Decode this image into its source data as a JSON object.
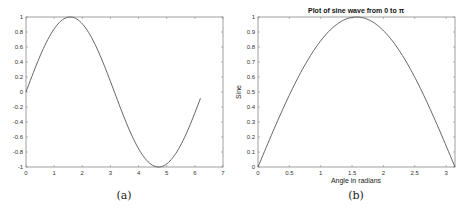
{
  "chart_data": [
    {
      "id": "a",
      "type": "line",
      "title": "",
      "caption": "(a)",
      "xlabel": "",
      "ylabel": "",
      "xlim": [
        0,
        7
      ],
      "ylim": [
        -1,
        1
      ],
      "xticks": [
        0,
        1,
        2,
        3,
        4,
        5,
        6,
        7
      ],
      "xtick_labels": [
        "0",
        "1",
        "2",
        "3",
        "4",
        "5",
        "6",
        "7"
      ],
      "yticks": [
        -1,
        -0.8,
        -0.6,
        -0.4,
        -0.2,
        0,
        0.2,
        0.4,
        0.6,
        0.8,
        1
      ],
      "ytick_labels": [
        "-1",
        "-0.8",
        "-0.6",
        "-0.4",
        "-0.2",
        "0",
        "0.2",
        "0.4",
        "0.6",
        "0.8",
        "1"
      ],
      "grid": false,
      "series": [
        {
          "name": "sin(x)",
          "function": "sin",
          "x_start": 0,
          "x_end": 6.2,
          "x": [
            0,
            0.5,
            1,
            1.5708,
            2,
            2.5,
            3,
            3.5,
            4,
            4.7124,
            5,
            5.5,
            6,
            6.2
          ],
          "y": [
            0,
            0.479,
            0.841,
            1,
            0.909,
            0.598,
            0.141,
            -0.351,
            -0.757,
            -1,
            -0.959,
            -0.706,
            -0.279,
            -0.083
          ],
          "color": "#555555"
        }
      ]
    },
    {
      "id": "b",
      "type": "line",
      "title": "Plot of sine wave from 0 to π",
      "caption": "(b)",
      "xlabel": "Angle in radians",
      "ylabel": "Sine",
      "xlim": [
        0,
        3.1416
      ],
      "ylim": [
        0,
        1
      ],
      "xticks": [
        0,
        0.5,
        1,
        1.5,
        2,
        2.5,
        3
      ],
      "xtick_labels": [
        "0",
        "0.5",
        "1",
        "1.5",
        "2",
        "2.5",
        "3"
      ],
      "yticks": [
        0,
        0.1,
        0.2,
        0.3,
        0.4,
        0.5,
        0.6,
        0.7,
        0.8,
        0.9,
        1
      ],
      "ytick_labels": [
        "0",
        "0.1",
        "0.2",
        "0.3",
        "0.4",
        "0.5",
        "0.6",
        "0.7",
        "0.8",
        "0.9",
        "1"
      ],
      "grid": false,
      "series": [
        {
          "name": "sin(x)",
          "function": "sin",
          "x_start": 0,
          "x_end": 3.1416,
          "x": [
            0,
            0.5,
            1,
            1.5708,
            2,
            2.5,
            3,
            3.1416
          ],
          "y": [
            0,
            0.479,
            0.841,
            1,
            0.909,
            0.598,
            0.141,
            0
          ],
          "color": "#555555"
        }
      ]
    }
  ]
}
